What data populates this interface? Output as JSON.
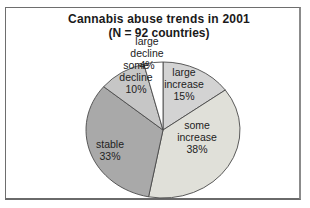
{
  "chart_data": {
    "type": "pie",
    "title": "Cannabis abuse trends in 2001",
    "subtitle": "(N = 92 countries)",
    "start_angle_deg": 0,
    "direction": "clockwise",
    "legend_position": "none",
    "outline_color": "#4a4a4a",
    "geometry": {
      "cx": 163,
      "cy": 130,
      "rx": 77,
      "ry": 68
    },
    "slices": [
      {
        "label": "large increase",
        "value_pct": 15,
        "color": "#d3d3d3",
        "label_lines": [
          "large",
          "increase",
          "15%"
        ],
        "label_x": 184,
        "label_y": 84
      },
      {
        "label": "some increase",
        "value_pct": 38,
        "color": "#e0e0d9",
        "label_lines": [
          "some",
          "increase",
          "38%"
        ],
        "label_x": 197,
        "label_y": 137
      },
      {
        "label": "stable",
        "value_pct": 33,
        "color": "#a9a9a9",
        "label_lines": [
          "stable",
          "33%"
        ],
        "label_x": 110,
        "label_y": 150
      },
      {
        "label": "some decline",
        "value_pct": 10,
        "color": "#c6c6c6",
        "label_lines": [
          "some",
          "decline",
          "10%"
        ],
        "label_x": 136,
        "label_y": 77
      },
      {
        "label": "large decline",
        "value_pct": 4,
        "color": "#ffffff",
        "label_lines": [
          "large",
          "decline",
          "4%"
        ],
        "label_x": 147,
        "label_y": 53
      }
    ]
  }
}
